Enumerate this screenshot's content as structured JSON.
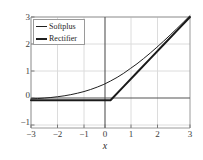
{
  "chart_data": {
    "type": "line",
    "title": "",
    "subtitle": "",
    "xlabel": "x",
    "ylabel": "",
    "xlim": [
      -3,
      3
    ],
    "ylim": [
      -1,
      3
    ],
    "grid": true,
    "grid_color": "#dcdcdc",
    "axis_color": "#555555",
    "spine_color": "#9a9a9a",
    "legend_position": "upper left",
    "xticks": [
      -3,
      -2,
      -1,
      0,
      1,
      2,
      3
    ],
    "xtick_labels": [
      "−3",
      "−2",
      "−1",
      "0",
      "1",
      "2",
      "3"
    ],
    "yticks": [
      -1,
      0,
      1,
      2,
      3
    ],
    "ytick_labels": [
      "−1",
      "0",
      "1",
      "2",
      "3"
    ],
    "series": [
      {
        "name": "Softplus",
        "color": "#202020",
        "linewidth": 1,
        "x": [
          -3,
          -2.75,
          -2.5,
          -2.25,
          -2,
          -1.75,
          -1.5,
          -1.25,
          -1,
          -0.75,
          -0.5,
          -0.25,
          0,
          0.25,
          0.5,
          0.75,
          1,
          1.25,
          1.5,
          1.75,
          2,
          2.25,
          2.5,
          2.75,
          3
        ],
        "values": [
          0.0486,
          0.0618,
          0.0783,
          0.0989,
          0.1269,
          0.1592,
          0.2014,
          0.2529,
          0.3133,
          0.3877,
          0.4741,
          0.5722,
          0.6931,
          0.8239,
          0.9741,
          1.1441,
          1.3133,
          1.5029,
          1.7014,
          1.9101,
          2.1269,
          2.3497,
          2.5783,
          2.8113,
          3.0486
        ]
      },
      {
        "name": "Rectifier",
        "color": "#1a1a1a",
        "linewidth": 2,
        "x": [
          -3,
          -2.5,
          -2,
          -1.5,
          -1,
          -0.5,
          0,
          0.5,
          1,
          1.5,
          2,
          2.5,
          3
        ],
        "values": [
          0,
          0,
          0,
          0,
          0,
          0,
          0,
          0.5,
          1,
          1.5,
          2,
          2.5,
          3
        ]
      }
    ]
  },
  "legend": {
    "entries": [
      {
        "label": "Softplus",
        "style": "thin"
      },
      {
        "label": "Rectifier",
        "style": "thick"
      }
    ]
  },
  "axis_label": {
    "x": "x"
  }
}
